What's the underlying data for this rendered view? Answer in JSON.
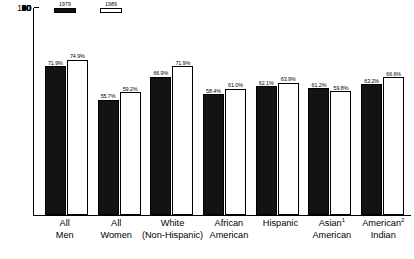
{
  "chart_data": {
    "type": "bar",
    "title": "",
    "subtitle": "",
    "xlabel": "",
    "ylabel": "",
    "ylim": [
      0,
      100
    ],
    "yticks": [
      100,
      90,
      80,
      70,
      60,
      50,
      40,
      30,
      20,
      10
    ],
    "grid": false,
    "legend_position": "top-left",
    "categories": [
      "All Men",
      "All Women",
      "White (Non-Hispanic)",
      "African American",
      "Hispanic",
      "Asian American",
      "American Indian"
    ],
    "category_lines": [
      {
        "line1": "All",
        "line2": "Men",
        "sup": ""
      },
      {
        "line1": "All",
        "line2": "Women",
        "sup": ""
      },
      {
        "line1": "White",
        "line2": "(Non-Hispanic)",
        "sup": ""
      },
      {
        "line1": "African",
        "line2": "American",
        "sup": ""
      },
      {
        "line1": "Hispanic",
        "line2": "",
        "sup": ""
      },
      {
        "line1": "Asian",
        "line2": "American",
        "sup": "1"
      },
      {
        "line1": "American",
        "line2": "Indian",
        "sup": "2"
      }
    ],
    "series": [
      {
        "name": "1979",
        "style": "filled-black",
        "values": [
          71.9,
          55.7,
          66.9,
          58.4,
          62.1,
          61.2,
          63.2
        ],
        "labels": [
          "71.9%",
          "55.7%",
          "66.9%",
          "58.4%",
          "62.1%",
          "61.2%",
          "63.2%"
        ]
      },
      {
        "name": "1989",
        "style": "outline-white",
        "values": [
          74.9,
          59.2,
          71.9,
          61.0,
          63.9,
          59.8,
          66.6
        ],
        "labels": [
          "74.9%",
          "59.2%",
          "71.9%",
          "61.0%",
          "63.9%",
          "59.8%",
          "66.6%"
        ]
      }
    ],
    "colors": {
      "series_1979": "#131313",
      "series_1989": "#ffffff",
      "axis": "#000000",
      "background": "#ffffff"
    }
  },
  "legend": {
    "entries": [
      {
        "label": "1979"
      },
      {
        "label": "1989"
      }
    ]
  }
}
